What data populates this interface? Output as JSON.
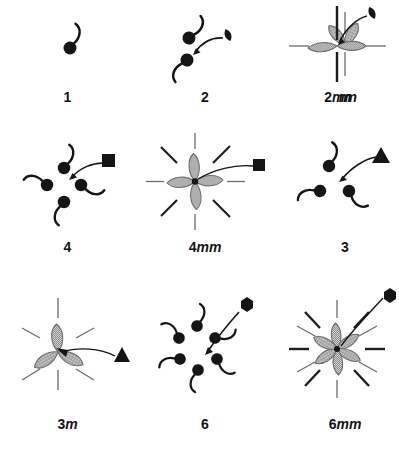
{
  "figure": {
    "background_color": "#ffffff",
    "ink_color": "#151515",
    "petal_fill_color": "#b9b9b9",
    "petal_edge_color": "#6e6e6e",
    "mirror_line_color": "#6b6b6b",
    "solid_line_color": "#1d1d1d"
  },
  "groups": [
    {
      "id": "group-1",
      "label_plain": "1",
      "label_number": "1",
      "label_mirror": "",
      "order": 1,
      "type": "rotation",
      "axis_symbol": "none",
      "axis_symbol_glyph": "",
      "comma_count": 1,
      "petal_count": 0,
      "mirror_line_count": 0,
      "has_arrow": false,
      "description": "Identity: a single asymmetric comma motif, no symmetry element drawn"
    },
    {
      "id": "group-2",
      "label_plain": "2",
      "label_number": "2",
      "label_mirror": "",
      "order": 2,
      "type": "rotation",
      "axis_symbol": "lens",
      "axis_symbol_glyph": "lens-2fold-icon",
      "comma_count": 2,
      "petal_count": 0,
      "mirror_line_count": 0,
      "has_arrow": true,
      "description": "Two-fold rotation: two commas related by 180 degree rotation, pointed-lens axis symbol with curved arrow"
    },
    {
      "id": "group-m",
      "label_plain": "m",
      "label_number": "",
      "label_mirror": "m",
      "order": 2,
      "type": "mirror",
      "axis_symbol": "none",
      "axis_symbol_glyph": "",
      "comma_count": 0,
      "petal_count": 2,
      "mirror_line_count": 1,
      "has_arrow": false,
      "description": "Single mirror line, two hatched petals reflected across a vertical dashed mirror"
    },
    {
      "id": "group-2mm",
      "label_plain": "2mm",
      "label_number": "2",
      "label_mirror": "mm",
      "order": 4,
      "type": "rotation+mirror",
      "axis_symbol": "lens",
      "axis_symbol_glyph": "lens-2fold-icon",
      "comma_count": 0,
      "petal_count": 2,
      "mirror_line_count": 2,
      "has_arrow": true,
      "description": "Two-fold axis with two mirror lines; thick vertical mirror, dashed horizontal mirror, two hatched petals"
    },
    {
      "id": "group-4",
      "label_plain": "4",
      "label_number": "4",
      "label_mirror": "",
      "order": 4,
      "type": "rotation",
      "axis_symbol": "square",
      "axis_symbol_glyph": "square-4fold-icon",
      "comma_count": 4,
      "petal_count": 0,
      "mirror_line_count": 0,
      "has_arrow": true,
      "description": "Four-fold rotation: four commas at 90 degree intervals, filled square axis symbol with curved arrow"
    },
    {
      "id": "group-4mm",
      "label_plain": "4mm",
      "label_number": "4",
      "label_mirror": "mm",
      "order": 8,
      "type": "rotation+mirror",
      "axis_symbol": "square",
      "axis_symbol_glyph": "square-4fold-icon",
      "comma_count": 0,
      "petal_count": 4,
      "mirror_line_count": 4,
      "has_arrow": false,
      "description": "Four-fold axis with four mirror lines; four hatched petals and eight radiating mirror half-lines"
    },
    {
      "id": "group-3",
      "label_plain": "3",
      "label_number": "3",
      "label_mirror": "",
      "order": 3,
      "type": "rotation",
      "axis_symbol": "triangle",
      "axis_symbol_glyph": "triangle-3fold-icon",
      "comma_count": 3,
      "petal_count": 0,
      "mirror_line_count": 0,
      "has_arrow": true,
      "description": "Three-fold rotation: three commas at 120 degree intervals, filled triangle axis symbol with curved arrow"
    },
    {
      "id": "group-3m",
      "label_plain": "3m",
      "label_number": "3",
      "label_mirror": "m",
      "order": 6,
      "type": "rotation+mirror",
      "axis_symbol": "triangle",
      "axis_symbol_glyph": "triangle-3fold-icon",
      "comma_count": 0,
      "petal_count": 3,
      "mirror_line_count": 3,
      "has_arrow": false,
      "description": "Three-fold axis with three mirror lines; three hatched petals and six radiating dashed half-lines"
    },
    {
      "id": "group-6",
      "label_plain": "6",
      "label_number": "6",
      "label_mirror": "",
      "order": 6,
      "type": "rotation",
      "axis_symbol": "hexagon",
      "axis_symbol_glyph": "hexagon-6fold-icon",
      "comma_count": 6,
      "petal_count": 0,
      "mirror_line_count": 0,
      "has_arrow": true,
      "description": "Six-fold rotation: six commas at 60 degree intervals, filled hexagon axis symbol with long curved arrow"
    },
    {
      "id": "group-6mm",
      "label_plain": "6mm",
      "label_number": "6",
      "label_mirror": "mm",
      "order": 12,
      "type": "rotation+mirror",
      "axis_symbol": "hexagon",
      "axis_symbol_glyph": "hexagon-6fold-icon",
      "comma_count": 0,
      "petal_count": 6,
      "mirror_line_count": 6,
      "has_arrow": false,
      "description": "Six-fold axis with six mirror lines; six hatched petals and twelve radiating half-lines alternating thick solid and thin dashed"
    }
  ]
}
